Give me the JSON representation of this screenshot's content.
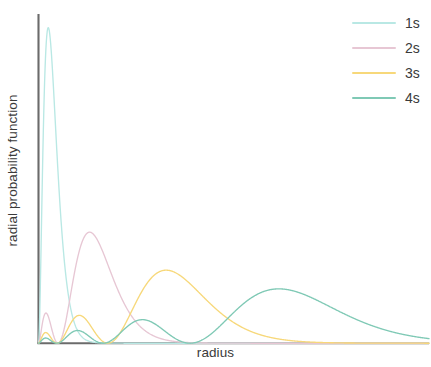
{
  "chart_data": {
    "type": "line",
    "title": "",
    "xlabel": "radius",
    "ylabel": "radial probability function",
    "grid": false,
    "legend_position": "top-right",
    "xlim": [
      0,
      40
    ],
    "ylim": [
      0,
      0.56
    ],
    "x_axis_ticks": [],
    "y_axis_ticks": [],
    "series": [
      {
        "name": "1s",
        "color": "#b9e8e4",
        "n": 1,
        "nodes": 0,
        "peak_radius": 1.0,
        "peak_value": 0.54,
        "maxima": [
          {
            "r": 1.0,
            "p": 0.54
          }
        ]
      },
      {
        "name": "2s",
        "color": "#e7c7d4",
        "n": 2,
        "nodes": 1,
        "peak_radius": 5.2,
        "peak_value": 0.19,
        "maxima": [
          {
            "r": 0.75,
            "p": 0.043
          },
          {
            "r": 5.2,
            "p": 0.19
          }
        ]
      },
      {
        "name": "3s",
        "color": "#f7d87a",
        "n": 3,
        "nodes": 2,
        "peak_radius": 13.1,
        "peak_value": 0.125,
        "maxima": [
          {
            "r": 0.72,
            "p": 0.022
          },
          {
            "r": 4.2,
            "p": 0.035
          },
          {
            "r": 13.1,
            "p": 0.125
          }
        ]
      },
      {
        "name": "4s",
        "color": "#7fc9b5",
        "n": 4,
        "nodes": 3,
        "peak_radius": 23.5,
        "peak_value": 0.093,
        "maxima": [
          {
            "r": 0.7,
            "p": 0.014
          },
          {
            "r": 3.9,
            "p": 0.022
          },
          {
            "r": 10.4,
            "p": 0.036
          },
          {
            "r": 23.5,
            "p": 0.093
          }
        ]
      }
    ]
  },
  "legend": {
    "items": [
      {
        "label": "1s",
        "color": "#b9e8e4"
      },
      {
        "label": "2s",
        "color": "#e7c7d4"
      },
      {
        "label": "3s",
        "color": "#f7d87a"
      },
      {
        "label": "4s",
        "color": "#7fc9b5"
      }
    ]
  },
  "axes": {
    "x_title": "radius",
    "y_title": "radial probability function",
    "axis_color": "#6b6b6b"
  }
}
